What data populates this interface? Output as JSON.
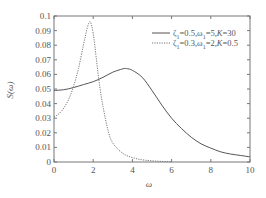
{
  "chart_data": {
    "type": "line",
    "title": "",
    "xlabel": "ω",
    "ylabel": "S(ω)",
    "xlim": [
      0,
      10
    ],
    "ylim": [
      0,
      0.1
    ],
    "grid": false,
    "legend_position": "upper right",
    "x_ticks": [
      "0",
      "2",
      "4",
      "6",
      "8",
      "10"
    ],
    "y_ticks": [
      "0",
      "0.01",
      "0.02",
      "0.03",
      "0.04",
      "0.05",
      "0.06",
      "0.07",
      "0.08",
      "0.09",
      "0.1"
    ],
    "series": [
      {
        "name": "ζ1=0.5,ω1=5,K=30",
        "style": "solid",
        "x": [
          0,
          0.5,
          1,
          1.5,
          2,
          2.5,
          3,
          3.5,
          3.7,
          4,
          4.5,
          5,
          5.5,
          6,
          6.5,
          7,
          7.5,
          8,
          8.5,
          9,
          9.5,
          10
        ],
        "values": [
          0.049,
          0.0495,
          0.051,
          0.053,
          0.055,
          0.058,
          0.0615,
          0.0638,
          0.064,
          0.0628,
          0.058,
          0.049,
          0.039,
          0.03,
          0.023,
          0.017,
          0.0125,
          0.0095,
          0.007,
          0.0055,
          0.0045,
          0.0035
        ]
      },
      {
        "name": "ζ1=0.3,ω1=2,K=0.5",
        "style": "dotted",
        "x": [
          0,
          0.25,
          0.5,
          0.75,
          1,
          1.25,
          1.5,
          1.7,
          1.85,
          2,
          2.15,
          2.3,
          2.5,
          2.75,
          3,
          3.5,
          4,
          4.5,
          5,
          5.5,
          6
        ],
        "values": [
          0.031,
          0.033,
          0.037,
          0.043,
          0.052,
          0.064,
          0.08,
          0.092,
          0.096,
          0.088,
          0.072,
          0.055,
          0.038,
          0.022,
          0.013,
          0.006,
          0.003,
          0.0015,
          0.0008,
          0.0004,
          0.0002
        ]
      }
    ]
  },
  "legend": {
    "solid_label": "ζ1=0.5,ω1=5,K=30",
    "dotted_label": "ζ1=0.3,ω1=2,K=0.5"
  },
  "axes": {
    "xlabel": "ω",
    "ylabel": "S(ω)"
  }
}
